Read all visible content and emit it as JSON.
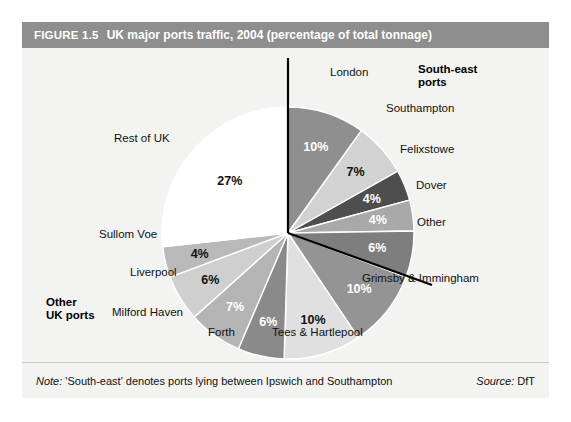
{
  "figure": {
    "number": "FIGURE 1.5",
    "title": "UK major ports traffic, 2004 (percentage of total tonnage)",
    "note_lead": "Note:",
    "note_text": " 'South-east' denotes ports lying between Ipswich and Southampton",
    "source_lead": "Source:",
    "source_text": " DfT"
  },
  "groups": {
    "south_east": "South-east\nports",
    "south_east_line1": "South-east",
    "south_east_line2": "ports",
    "other_uk_line1": "Other",
    "other_uk_line2": "UK ports"
  },
  "colors": {
    "header_bar": "#8e8e8e",
    "panel_bg": "#f3f3f1",
    "divider": "#000000",
    "footer_rule": "#c9c9c7"
  },
  "chart_data": {
    "type": "pie",
    "title": "UK major ports traffic, 2004 (percentage of total tonnage)",
    "unit": "percentage of total tonnage",
    "start_angle_deg": 0,
    "direction": "clockwise",
    "legend_position": "labels-around-pie",
    "grid": false,
    "categories": [
      "London",
      "Southampton",
      "Felixstowe",
      "Dover",
      "Other",
      "Grimsby & Immingham",
      "Tees & Hartlepool",
      "Forth",
      "Milford Haven",
      "Liverpool",
      "Sullom Voe",
      "Rest of UK"
    ],
    "values": [
      10,
      7,
      4,
      4,
      6,
      10,
      10,
      6,
      7,
      6,
      4,
      27
    ],
    "value_labels": [
      "10%",
      "7%",
      "4%",
      "4%",
      "6%",
      "10%",
      "10%",
      "6%",
      "7%",
      "6%",
      "4%",
      "27%"
    ],
    "slice_colors": [
      "#8f8f8f",
      "#d2d2d2",
      "#4e4e4e",
      "#a9a9a9",
      "#7e7e7e",
      "#949494",
      "#e0e0e0",
      "#8a8a8a",
      "#b4b4b4",
      "#cfcfcf",
      "#b9b9b9",
      "#ffffff"
    ],
    "label_text_colors": [
      "#ffffff",
      "#111111",
      "#ffffff",
      "#ffffff",
      "#ffffff",
      "#ffffff",
      "#111111",
      "#ffffff",
      "#ffffff",
      "#111111",
      "#111111",
      "#111111"
    ],
    "groups": [
      {
        "name": "South-east ports",
        "members": [
          "London",
          "Southampton",
          "Felixstowe",
          "Dover",
          "Other"
        ],
        "total": 31
      },
      {
        "name": "Other UK ports",
        "members": [
          "Grimsby & Immingham",
          "Tees & Hartlepool",
          "Forth",
          "Milford Haven",
          "Liverpool",
          "Sullom Voe",
          "Rest of UK"
        ],
        "total": 69
      }
    ]
  }
}
